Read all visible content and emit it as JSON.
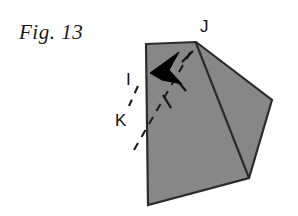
{
  "figure": {
    "caption": "Fig. 13",
    "background_color": "#ffffff",
    "paper_fill_color": "#878787",
    "outline_color": "#2b2b2b",
    "crease_color": "#2b2b2b",
    "arrow_color": "#000000",
    "dash_color": "#1d1d1d",
    "labels": [
      {
        "id": "label-J",
        "text": "J",
        "x": 205,
        "y": 28
      },
      {
        "id": "label-I",
        "text": "I",
        "x": 130,
        "y": 80
      },
      {
        "id": "label-K",
        "text": "K",
        "x": 121,
        "y": 122
      }
    ],
    "shape": {
      "type": "folded-paper-polygon",
      "outline_points": "146,44 196,42 272,100 249,178 148,205",
      "crease_lines": [
        {
          "name": "crease-J-to-bottom-fold",
          "points": "196,42 249,178"
        }
      ]
    },
    "annotations": {
      "fold_arrow": {
        "name": "fold-direction-arrow",
        "head_points": "150,72 178,53 168,69 181,83 163,79",
        "dashes": [
          {
            "points": "184,62 196,50"
          },
          {
            "points": "176,78 188,88"
          },
          {
            "points": "166,92 175,104"
          }
        ]
      },
      "fold_guide_line": {
        "name": "fold-guide-dashed-line",
        "points": "134,148 196,44",
        "dash_pattern": "7 6"
      },
      "edge_guide_line": {
        "name": "edge-guide-dashed-line",
        "points": "136,88 130,104",
        "dash_pattern": "7 6"
      }
    }
  }
}
